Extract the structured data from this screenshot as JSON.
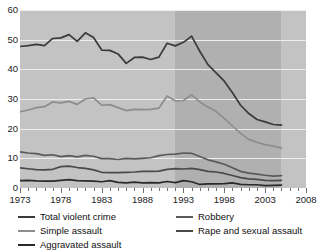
{
  "chart_data": {
    "type": "line",
    "title": "",
    "xlabel": "",
    "ylabel": "",
    "xlim": [
      1973,
      2008
    ],
    "ylim": [
      0,
      60
    ],
    "grid": true,
    "legend_position": "bottom",
    "y_ticks": [
      0,
      10,
      20,
      30,
      40,
      50,
      60
    ],
    "x_ticks": [
      1973,
      1978,
      1983,
      1988,
      1993,
      1998,
      2003,
      2008
    ],
    "x_tick_labels": [
      "1973",
      "1978",
      "1983",
      "1988",
      "1993",
      "1998",
      "2003",
      "2008"
    ],
    "y_tick_labels": [
      "0",
      "10",
      "20",
      "30",
      "40",
      "50",
      "60"
    ],
    "x": [
      1973,
      1974,
      1975,
      1976,
      1977,
      1978,
      1979,
      1980,
      1981,
      1982,
      1983,
      1984,
      1985,
      1986,
      1987,
      1988,
      1989,
      1990,
      1991,
      1992,
      1993,
      1994,
      1995,
      1996,
      1997,
      1998,
      1999,
      2000,
      2001,
      2002,
      2003,
      2004,
      2005
    ],
    "series": [
      {
        "name": "Total violent crime",
        "color": "#3a3a3a",
        "values": [
          47.7,
          48.0,
          48.4,
          48.0,
          50.4,
          50.6,
          51.7,
          49.4,
          52.3,
          50.7,
          46.5,
          46.4,
          45.2,
          42.0,
          44.0,
          44.1,
          43.3,
          44.1,
          48.8,
          47.9,
          49.1,
          51.2,
          46.1,
          41.6,
          38.8,
          36.0,
          32.1,
          27.9,
          25.1,
          23.1,
          22.3,
          21.4,
          21.2
        ]
      },
      {
        "name": "Simple assault",
        "color": "#8d8d8d",
        "values": [
          25.7,
          26.3,
          27.1,
          27.4,
          29.0,
          28.7,
          29.2,
          28.2,
          30.0,
          30.4,
          27.9,
          28.1,
          27.1,
          26.1,
          26.5,
          26.4,
          26.5,
          26.9,
          31.0,
          29.4,
          29.5,
          31.4,
          29.0,
          27.3,
          25.8,
          23.5,
          20.9,
          18.4,
          16.4,
          15.4,
          14.6,
          14.1,
          13.5
        ]
      },
      {
        "name": "Robbery",
        "color": "#5a5a5a",
        "values": [
          12.2,
          11.8,
          11.6,
          11.0,
          11.2,
          10.6,
          10.9,
          10.5,
          11.0,
          10.7,
          9.9,
          9.9,
          9.6,
          10.0,
          9.8,
          10.0,
          10.2,
          10.9,
          11.3,
          11.4,
          11.8,
          11.7,
          10.6,
          9.5,
          8.8,
          8.0,
          6.8,
          5.6,
          5.0,
          4.7,
          4.3,
          4.0,
          4.2
        ]
      },
      {
        "name": "Rape and sexual assault",
        "color": "#4a4a4a",
        "values": [
          6.8,
          6.5,
          6.2,
          6.1,
          6.3,
          7.2,
          7.4,
          6.9,
          6.6,
          6.1,
          5.3,
          5.2,
          5.2,
          5.3,
          5.4,
          5.6,
          5.6,
          5.7,
          6.3,
          6.5,
          6.4,
          6.6,
          6.2,
          5.6,
          5.4,
          4.9,
          4.2,
          3.5,
          3.1,
          2.9,
          2.6,
          2.5,
          2.6
        ]
      },
      {
        "name": "Aggravated assault",
        "color": "#2a2a2a",
        "values": [
          2.5,
          2.6,
          2.4,
          2.3,
          2.3,
          2.6,
          2.8,
          2.5,
          2.4,
          2.3,
          2.1,
          2.5,
          1.9,
          1.7,
          2.0,
          1.7,
          1.8,
          1.7,
          2.2,
          1.8,
          2.5,
          2.1,
          1.2,
          1.4,
          1.4,
          1.5,
          1.7,
          1.2,
          1.1,
          1.1,
          0.8,
          0.9,
          1.0
        ]
      }
    ],
    "shaded_band": {
      "start": 1992,
      "end": 2005,
      "note": "darker background band"
    }
  },
  "top_caption_fragment": "",
  "legend": {
    "items": [
      {
        "label": "Total violent crime",
        "color": "#3a3a3a"
      },
      {
        "label": "Robbery",
        "color": "#5a5a5a"
      },
      {
        "label": "Simple assault",
        "color": "#8d8d8d"
      },
      {
        "label": "Rape and sexual assault",
        "color": "#4a4a4a"
      },
      {
        "label": "Aggravated assault",
        "color": "#2a2a2a"
      }
    ]
  },
  "colors": {
    "plot_background_light": "#c3c3c3",
    "plot_background_dark": "#b0b0b0",
    "gridline": "#eeeeee",
    "axis_text": "#222222"
  }
}
